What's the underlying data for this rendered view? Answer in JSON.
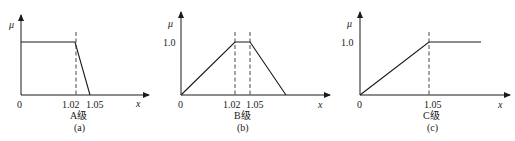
{
  "figure": {
    "axis_labels": {
      "y": "μ",
      "x": "x"
    },
    "panels": [
      {
        "id": "a",
        "grade_label": "A级",
        "caption": "(a)",
        "origin_label": "0",
        "y_tick_label": "",
        "x_ticks": [
          {
            "value": 1.02,
            "label": "1.02"
          },
          {
            "value": 1.05,
            "label": "1.05"
          }
        ],
        "shape": "z-shaped (decreasing)",
        "points": [
          [
            0,
            1.0
          ],
          [
            1.02,
            1.0
          ],
          [
            1.05,
            0
          ]
        ],
        "dashed_at": [
          1.02
        ]
      },
      {
        "id": "b",
        "grade_label": "B级",
        "caption": "(b)",
        "origin_label": "0",
        "y_tick_label": "1.0",
        "x_ticks": [
          {
            "value": 1.02,
            "label": "1.02"
          },
          {
            "value": 1.05,
            "label": "1.05"
          }
        ],
        "shape": "trapezoidal",
        "points": [
          [
            0,
            0
          ],
          [
            1.02,
            1.0
          ],
          [
            1.05,
            1.0
          ],
          [
            null,
            0
          ]
        ],
        "dashed_at": [
          1.02,
          1.05
        ]
      },
      {
        "id": "c",
        "grade_label": "C级",
        "caption": "(c)",
        "origin_label": "0",
        "y_tick_label": "1.0",
        "x_ticks": [
          {
            "value": 1.05,
            "label": "1.05"
          }
        ],
        "shape": "s-shaped (increasing)",
        "points": [
          [
            0,
            0
          ],
          [
            1.05,
            1.0
          ],
          [
            null,
            1.0
          ]
        ],
        "dashed_at": [
          1.05
        ]
      }
    ]
  },
  "colors": {
    "line": "#1a1a1a",
    "background": "#ffffff"
  }
}
